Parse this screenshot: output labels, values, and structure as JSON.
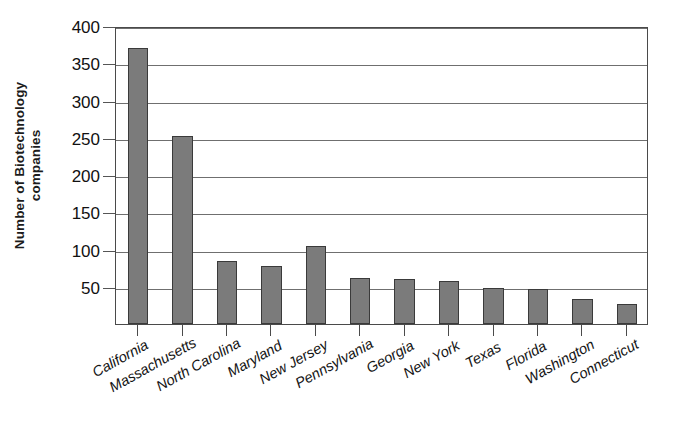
{
  "chart_data": {
    "type": "bar",
    "title": "",
    "subtitle": "",
    "xlabel": "",
    "ylabel": "Number of Biotechnology companies",
    "ylabel_lines": [
      "Number of Biotechnology",
      "companies"
    ],
    "categories": [
      "California",
      "Massachusetts",
      "North Carolina",
      "Maryland",
      "New Jersey",
      "Pennsylvania",
      "Georgia",
      "New York",
      "Texas",
      "Florida",
      "Washington",
      "Connecticut"
    ],
    "values": [
      370,
      253,
      84,
      78,
      105,
      62,
      60,
      58,
      49,
      47,
      34,
      27
    ],
    "ylim": [
      0,
      400
    ],
    "ytick_values": [
      50,
      100,
      150,
      200,
      250,
      300,
      350,
      400
    ],
    "ytick_labels": [
      "50",
      "100",
      "150",
      "200",
      "250",
      "300",
      "350",
      "400"
    ],
    "grid": true,
    "legend": false,
    "legend_position": "none",
    "bar_color": "#7b7b7b",
    "bar_border_color": "#3a3a3a",
    "grid_color": "#6f6f6f",
    "axis_color": "#4a4a4a",
    "background_color": "#ffffff",
    "text_color": "#141414",
    "xlabel_rotation_deg": -29
  }
}
